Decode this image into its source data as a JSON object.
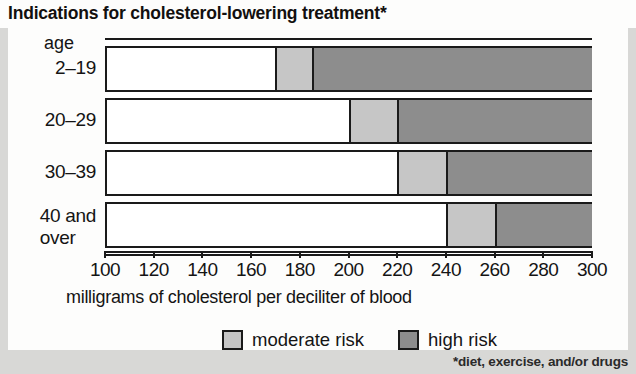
{
  "title": "Indications for cholesterol-lowering treatment*",
  "footnote": "*diet, exercise, and/or drugs",
  "axis": {
    "caption": "milligrams of cholesterol per deciliter of blood",
    "age_header": "age"
  },
  "legend": {
    "moderate_label": "moderate risk",
    "high_label": "high risk"
  },
  "colors": {
    "moderate": "#c6c6c6",
    "high": "#8d8d8d",
    "normal": "#ffffff",
    "line": "#1a1a1a",
    "paper": "#fdfdfc",
    "page": "#d8d8d6"
  },
  "chart_data": {
    "type": "bar",
    "orientation": "horizontal",
    "stacked": true,
    "title": "Indications for cholesterol-lowering treatment*",
    "xlabel": "milligrams of cholesterol per deciliter of blood",
    "ylabel": "age",
    "xlim": [
      100,
      300
    ],
    "xticks": [
      100,
      120,
      140,
      160,
      180,
      200,
      220,
      240,
      260,
      280,
      300
    ],
    "xtick_labels": [
      "100",
      "120",
      "140",
      "160",
      "180",
      "200",
      "220",
      "240",
      "260",
      "280",
      "300"
    ],
    "grid": true,
    "legend_position": "bottom",
    "categories": [
      "2–19",
      "20–29",
      "30–39",
      "40 and over"
    ],
    "category_lines": [
      [
        "2–19"
      ],
      [
        "20–29"
      ],
      [
        "30–39"
      ],
      [
        "40 and",
        "over"
      ]
    ],
    "series": [
      {
        "name": "moderate risk",
        "color": "#c6c6c6",
        "ranges": [
          [
            170,
            185
          ],
          [
            200,
            220
          ],
          [
            220,
            240
          ],
          [
            240,
            260
          ]
        ]
      },
      {
        "name": "high risk",
        "color": "#8d8d8d",
        "ranges": [
          [
            185,
            300
          ],
          [
            220,
            300
          ],
          [
            240,
            300
          ],
          [
            260,
            300
          ]
        ]
      }
    ],
    "bars": [
      {
        "category": "2–19",
        "moderate_start": 170,
        "moderate_end": 185,
        "high_start": 185,
        "high_end": 300
      },
      {
        "category": "20–29",
        "moderate_start": 200,
        "moderate_end": 220,
        "high_start": 220,
        "high_end": 300
      },
      {
        "category": "30–39",
        "moderate_start": 220,
        "moderate_end": 240,
        "high_start": 240,
        "high_end": 300
      },
      {
        "category": "40 and over",
        "moderate_start": 240,
        "moderate_end": 260,
        "high_start": 260,
        "high_end": 300
      }
    ]
  }
}
